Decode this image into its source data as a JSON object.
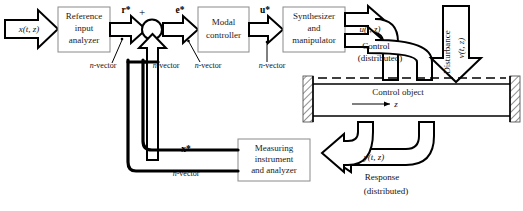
{
  "diagram": {
    "blocks": [
      {
        "id": "reference_input_analyzer",
        "lines": [
          "Reference",
          "input",
          "analyzer"
        ]
      },
      {
        "id": "modal_controller",
        "lines": [
          "Modal",
          "controller"
        ]
      },
      {
        "id": "synthesizer_and_manipulator",
        "lines": [
          "Synthesizer",
          "and",
          "manipulator"
        ]
      },
      {
        "id": "measuring_instrument_and_analyzer",
        "lines": [
          "Measuring",
          "instrument",
          "and analyzer"
        ]
      }
    ],
    "signals": {
      "input": "x(t, z)",
      "reference_star": "r*",
      "error_star": "e*",
      "control_star": "u*",
      "state_star": "x*",
      "control_distributed": "u(t, z)",
      "control_caption_line1": "Control",
      "control_caption_line2": "(distributed)",
      "disturbance_label": "Disturbance",
      "disturbance_signal": "v(t, z)",
      "response_signal": "y(t, z)",
      "response_caption_line1": "Response",
      "response_caption_line2": "(distributed)"
    },
    "summing_junction": {
      "id": "summing-junction",
      "plus_sign": "+",
      "minus_sign": "−"
    },
    "vector_annotations": [
      {
        "id": "nvec-r",
        "prefix": "n",
        "text": "-vector"
      },
      {
        "id": "nvec-feedback",
        "prefix": "n",
        "text": "-vector"
      },
      {
        "id": "nvec-e",
        "prefix": "n",
        "text": "-vector"
      },
      {
        "id": "nvec-u",
        "prefix": "n",
        "text": "-vector"
      },
      {
        "id": "nvec-x",
        "prefix": "n",
        "text": "-vector"
      }
    ],
    "plant": {
      "label": "Control object",
      "axis_label": "z"
    },
    "colors": {
      "stroke": "#000000",
      "block_border": "#8a8a8a",
      "background": "#ffffff",
      "hatch": "#555555"
    }
  }
}
